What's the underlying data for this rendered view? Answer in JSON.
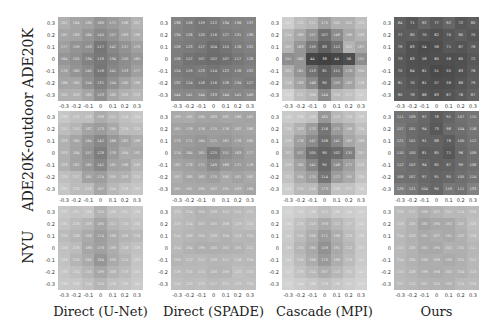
{
  "row_labels": [
    "ADE20K",
    "ADE20K-outdoor",
    "NYU"
  ],
  "col_labels": [
    "Direct (U-Net)",
    "Direct (SPADE)",
    "Cascade (MPI)",
    "Ours"
  ],
  "ticks": [
    "-0.3",
    "-0.2",
    "-0.1",
    "0",
    "0.1",
    "0.2",
    "0.3"
  ],
  "ytick_labels": [
    "0.3",
    "0.2",
    "0.1",
    "0",
    "-0.1",
    "-0.2",
    "-0.3"
  ],
  "chart_data": {
    "type": "heatmap",
    "title": "",
    "xlabel": "",
    "ylabel": "",
    "x_ticks": [
      -0.3,
      -0.2,
      -0.1,
      0,
      0.1,
      0.2,
      0.3
    ],
    "y_ticks": [
      0.3,
      0.2,
      0.1,
      0,
      -0.1,
      -0.2,
      -0.3
    ],
    "colormap": "gray",
    "value_range": [
      0,
      300
    ],
    "panels": [
      {
        "row": "ADE20K",
        "col": "Direct (U-Net)",
        "values": [
          [
            201,
            184,
            180,
            160,
            171,
            186,
            207
          ],
          [
            187,
            183,
            164,
            145,
            157,
            183,
            198
          ],
          [
            177,
            159,
            153,
            117,
            142,
            157,
            179
          ],
          [
            164,
            155,
            134,
            119,
            134,
            150,
            165
          ],
          [
            178,
            160,
            145,
            118,
            141,
            153,
            177
          ],
          [
            186,
            185,
            154,
            131,
            154,
            180,
            198
          ],
          [
            202,
            203,
            185,
            153,
            185,
            203,
            213
          ]
        ]
      },
      {
        "row": "ADE20K",
        "col": "Direct (SPADE)",
        "values": [
          [
            136,
            126,
            119,
            122,
            134,
            136,
            137
          ],
          [
            134,
            126,
            120,
            116,
            127,
            131,
            138
          ],
          [
            128,
            123,
            117,
            104,
            115,
            126,
            132
          ],
          [
            126,
            112,
            107,
            102,
            107,
            117,
            126
          ],
          [
            124,
            119,
            123,
            114,
            122,
            126,
            132
          ],
          [
            132,
            124,
            116,
            116,
            126,
            134,
            127
          ],
          [
            144,
            141,
            144,
            133,
            144,
            141,
            149
          ]
        ]
      },
      {
        "row": "ADE20K",
        "col": "Cascade (MPI)",
        "values": [
          [
            247,
            222,
            211,
            175,
            202,
            202,
            225
          ],
          [
            214,
            189,
            157,
            107,
            149,
            188,
            208
          ],
          [
            207,
            163,
            119,
            83,
            112,
            207,
            187
          ],
          [
            151,
            160,
            44,
            38,
            44,
            56,
            151
          ],
          [
            201,
            161,
            113,
            81,
            111,
            170,
            204
          ],
          [
            216,
            183,
            146,
            90,
            153,
            182,
            216
          ],
          [
            253,
            221,
            208,
            144,
            218,
            227,
            247
          ]
        ]
      },
      {
        "row": "ADE20K",
        "col": "Ours",
        "values": [
          [
            84,
            71,
            92,
            77,
            92,
            72,
            80
          ],
          [
            77,
            80,
            70,
            62,
            70,
            80,
            70
          ],
          [
            79,
            63,
            54,
            58,
            71,
            67,
            78
          ],
          [
            73,
            63,
            58,
            60,
            58,
            60,
            72
          ],
          [
            75,
            64,
            61,
            51,
            55,
            63,
            76
          ],
          [
            81,
            70,
            61,
            57,
            58,
            68,
            79
          ],
          [
            80,
            78,
            68,
            63,
            67,
            76,
            87
          ]
        ]
      },
      {
        "row": "ADE20K-outdoor",
        "col": "Direct (U-Net)",
        "values": [
          [
            236,
            225,
            223,
            196,
            211,
            224,
            234
          ],
          [
            221,
            210,
            182,
            173,
            190,
            219,
            220
          ],
          [
            203,
            185,
            164,
            142,
            166,
            182,
            198
          ],
          [
            203,
            184,
            157,
            128,
            170,
            194,
            192
          ],
          [
            203,
            182,
            165,
            141,
            181,
            186,
            209
          ],
          [
            225,
            217,
            181,
            174,
            200,
            203,
            225
          ],
          [
            235,
            220,
            218,
            187,
            214,
            228,
            235
          ]
        ]
      },
      {
        "row": "ADE20K-outdoor",
        "col": "Direct (SPADE)",
        "values": [
          [
            193,
            195,
            184,
            183,
            187,
            186,
            182
          ],
          [
            181,
            179,
            176,
            175,
            176,
            182,
            186
          ],
          [
            173,
            171,
            164,
            171,
            167,
            176,
            180
          ],
          [
            174,
            164,
            161,
            125,
            151,
            163,
            177
          ],
          [
            182,
            178,
            171,
            149,
            166,
            171,
            176
          ],
          [
            197,
            185,
            182,
            175,
            190,
            181,
            192
          ],
          [
            191,
            191,
            190,
            192,
            191,
            193,
            186
          ]
        ]
      },
      {
        "row": "ADE20K-outdoor",
        "col": "Cascade (MPI)",
        "values": [
          [
            240,
            236,
            228,
            165,
            213,
            225,
            239
          ],
          [
            226,
            203,
            173,
            116,
            171,
            198,
            224
          ],
          [
            219,
            176,
            147,
            106,
            141,
            187,
            206
          ],
          [
            207,
            157,
            105,
            90,
            102,
            131,
            207
          ],
          [
            219,
            180,
            141,
            95,
            148,
            177,
            220
          ],
          [
            227,
            194,
            175,
            114,
            172,
            191,
            229
          ],
          [
            245,
            215,
            216,
            173,
            228,
            227,
            246
          ]
        ]
      },
      {
        "row": "ADE20K-outdoor",
        "col": "Ours",
        "values": [
          [
            111,
            109,
            97,
            78,
            91,
            107,
            115
          ],
          [
            117,
            101,
            94,
            73,
            98,
            104,
            116
          ],
          [
            121,
            101,
            91,
            88,
            78,
            100,
            112
          ],
          [
            110,
            100,
            81,
            85,
            71,
            96,
            109
          ],
          [
            112,
            102,
            94,
            85,
            87,
            99,
            108
          ],
          [
            108,
            107,
            97,
            91,
            95,
            105,
            114
          ],
          [
            129,
            121,
            104,
            95,
            119,
            111,
            133
          ]
        ]
      },
      {
        "row": "NYU",
        "col": "Direct (U-Net)",
        "values": [
          [
            237,
            231,
            234,
            205,
            228,
            231,
            238
          ],
          [
            231,
            218,
            209,
            185,
            211,
            220,
            230
          ],
          [
            219,
            208,
            193,
            174,
            196,
            208,
            216
          ],
          [
            226,
            218,
            188,
            178,
            198,
            218,
            228
          ],
          [
            229,
            210,
            195,
            164,
            193,
            210,
            232
          ],
          [
            233,
            224,
            210,
            189,
            208,
            219,
            235
          ],
          [
            238,
            236,
            224,
            210,
            226,
            230,
            240
          ]
        ]
      },
      {
        "row": "NYU",
        "col": "Direct (SPADE)",
        "values": [
          [
            223,
            214,
            205,
            209,
            212,
            215,
            222
          ],
          [
            219,
            214,
            207,
            205,
            208,
            219,
            225
          ],
          [
            214,
            209,
            205,
            209,
            204,
            213,
            210
          ],
          [
            214,
            204,
            199,
            200,
            202,
            205,
            212
          ],
          [
            209,
            212,
            212,
            209,
            211,
            216,
            214
          ],
          [
            219,
            215,
            215,
            208,
            209,
            225,
            220
          ],
          [
            224,
            220,
            223,
            217,
            221,
            223,
            224
          ]
        ]
      },
      {
        "row": "NYU",
        "col": "Cascade (MPI)",
        "values": [
          [
            252,
            243,
            238,
            225,
            238,
            244,
            250
          ],
          [
            246,
            228,
            213,
            193,
            212,
            227,
            245
          ],
          [
            240,
            219,
            198,
            171,
            198,
            220,
            239
          ],
          [
            236,
            210,
            190,
            158,
            191,
            212,
            237
          ],
          [
            240,
            218,
            196,
            170,
            198,
            219,
            241
          ],
          [
            247,
            229,
            214,
            197,
            213,
            231,
            247
          ],
          [
            253,
            244,
            236,
            226,
            236,
            245,
            253
          ]
        ]
      },
      {
        "row": "NYU",
        "col": "Ours",
        "values": [
          [
            219,
            217,
            199,
            207,
            215,
            214,
            220
          ],
          [
            219,
            205,
            182,
            190,
            192,
            207,
            225
          ],
          [
            214,
            203,
            191,
            197,
            191,
            202,
            218
          ],
          [
            215,
            205,
            192,
            190,
            202,
            201,
            211
          ],
          [
            214,
            205,
            198,
            199,
            193,
            201,
            212
          ],
          [
            215,
            208,
            199,
            196,
            202,
            204,
            213
          ],
          [
            217,
            212,
            207,
            205,
            203,
            215,
            219
          ]
        ]
      }
    ]
  }
}
